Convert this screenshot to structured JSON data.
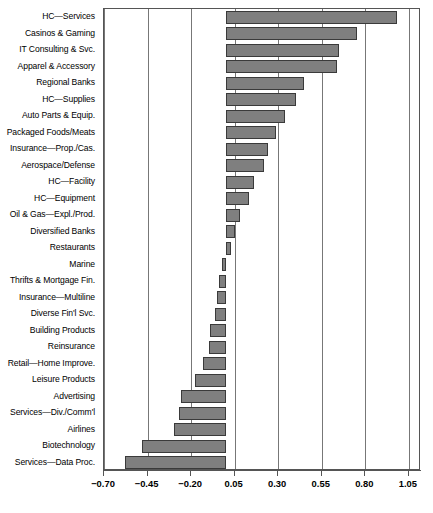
{
  "chart_data": {
    "type": "bar",
    "orientation": "horizontal",
    "title": "",
    "subtitle": "",
    "xlabel": "",
    "ylabel": "",
    "xlim": [
      -0.7,
      1.12
    ],
    "xticks": [
      -0.7,
      -0.45,
      -0.2,
      0.05,
      0.3,
      0.55,
      0.8,
      1.05
    ],
    "xticklabels": [
      "-0.70",
      "-0.45",
      "-0.20",
      "0.05",
      "0.30",
      "0.55",
      "0.80",
      "1.05"
    ],
    "grid": true,
    "grid_axis": "x",
    "legend": null,
    "bar_color": "#7f7f7f",
    "bar_edge_color": "#3a3a3a",
    "categories": [
      "HC—Services",
      "Casinos & Gaming",
      "IT Consulting & Svc.",
      "Apparel & Accessory",
      "Regional Banks",
      "HC—Supplies",
      "Auto Parts & Equip.",
      "Packaged Foods/Meats",
      "Insurance—Prop./Cas.",
      "Aerospace/Defense",
      "HC—Facility",
      "HC—Equipment",
      "Oil & Gas—Expl./Prod.",
      "Diversified Banks",
      "Restaurants",
      "Marine",
      "Thrifts & Mortgage Fin.",
      "Insurance—Multiline",
      "Diverse Fin'l Svc.",
      "Building Products",
      "Reinsurance",
      "Retail—Home Improve.",
      "Leisure Products",
      "Advertising",
      "Services—Div./Comm'l",
      "Airlines",
      "Biotechnology",
      "Services—Data Proc."
    ],
    "values": [
      0.98,
      0.75,
      0.65,
      0.64,
      0.45,
      0.4,
      0.34,
      0.29,
      0.24,
      0.22,
      0.16,
      0.13,
      0.08,
      0.05,
      0.03,
      -0.02,
      -0.04,
      -0.05,
      -0.06,
      -0.09,
      -0.1,
      -0.13,
      -0.18,
      -0.26,
      -0.27,
      -0.3,
      -0.48,
      -0.58
    ]
  }
}
